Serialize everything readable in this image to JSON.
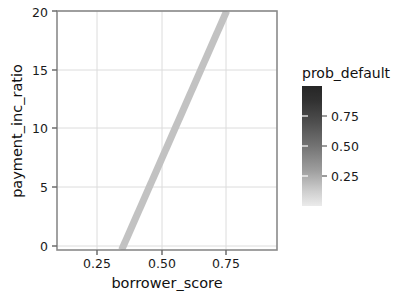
{
  "figure": {
    "background": "#ffffff",
    "plot_area": {
      "left": 57,
      "top": 11,
      "right": 277,
      "bottom": 250
    },
    "frame_color": "#8a8a8a",
    "grid_color": "#d9d9d9"
  },
  "axes": {
    "x_title": "borrower_score",
    "y_title": "payment_inc_ratio",
    "x_ticks": [
      "0.25",
      "0.50",
      "0.75"
    ],
    "y_ticks": [
      "0",
      "5",
      "10",
      "15",
      "20"
    ]
  },
  "legend": {
    "title": "prob_default",
    "ticks": [
      "0.75",
      "0.50",
      "0.25"
    ],
    "colorbar": {
      "top_color": "#2b2b2b",
      "bottom_color": "#e8e8e8",
      "x": 302,
      "y": 86,
      "width": 20,
      "height": 120
    }
  },
  "chart_data": {
    "type": "scatter",
    "title": "",
    "xlabel": "borrower_score",
    "ylabel": "payment_inc_ratio",
    "xlim": [
      0.095,
      0.912
    ],
    "ylim": [
      0,
      20.2
    ],
    "xticks": [
      0.25,
      0.5,
      0.75
    ],
    "yticks": [
      0,
      5,
      10,
      15,
      20
    ],
    "grid": true,
    "colormap": {
      "name": "grayscale-reversed",
      "label": "prob_default",
      "vmin": 0.0,
      "vmax": 1.0,
      "ticks": [
        0.25,
        0.5,
        0.75
      ],
      "low_color": "#e8e8e8",
      "high_color": "#2b2b2b"
    },
    "marker": {
      "shape": "circle",
      "size": 3.1,
      "alpha": 0.62
    },
    "score_columns": [
      0.115,
      0.15,
      0.2,
      0.25,
      0.3,
      0.35,
      0.4,
      0.45,
      0.5,
      0.55,
      0.6,
      0.65,
      0.7,
      0.75,
      0.8,
      0.85,
      0.9
    ],
    "column_counts": [
      4,
      6,
      22,
      34,
      62,
      96,
      150,
      175,
      185,
      185,
      160,
      120,
      86,
      54,
      26,
      10,
      4
    ],
    "decision_boundary": {
      "type": "line",
      "color": "#c2c2c2",
      "width": 7,
      "x_start": 0.335,
      "y_start": 0.0,
      "x_end": 0.725,
      "y_end": 20.2,
      "slope_note": "separating hyperplane of the fitted classifier"
    },
    "series": [
      {
        "name": "loan applicants",
        "n_points": 1379,
        "x_jitter": 0.012,
        "prob_default_model": "decreases with borrower_score, increases with payment_inc_ratio"
      }
    ]
  }
}
